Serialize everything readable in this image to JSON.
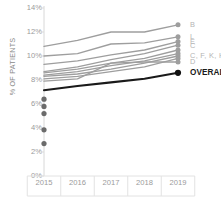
{
  "chart_data": {
    "type": "line",
    "title": "",
    "subtitle": "",
    "xlabel": "",
    "ylabel": "% OF PATIENTS",
    "x": [
      "2015",
      "2016",
      "2017",
      "2018",
      "2019"
    ],
    "xtick_labels": [
      "2015",
      "2016",
      "2017",
      "2018",
      "2019"
    ],
    "ytick_labels": [
      "0%",
      "2%",
      "4%",
      "6%",
      "8%",
      "10%",
      "12%",
      "14%"
    ],
    "ytick_values": [
      0,
      2,
      4,
      6,
      8,
      10,
      12,
      14
    ],
    "ylim": [
      0,
      14
    ],
    "grid": false,
    "legend_position": "right",
    "series": [
      {
        "name": "B",
        "color": "#9e9e9e",
        "values": [
          10.8,
          11.3,
          12.0,
          12.0,
          12.6
        ]
      },
      {
        "name": "L",
        "color": "#9e9e9e",
        "values": [
          10.0,
          10.2,
          11.0,
          11.1,
          11.6
        ]
      },
      {
        "name": "E",
        "color": "#9e9e9e",
        "values": [
          9.3,
          9.6,
          10.1,
          10.5,
          11.2
        ]
      },
      {
        "name": "C",
        "color": "#9e9e9e",
        "values": [
          8.7,
          9.1,
          9.7,
          10.2,
          10.9
        ]
      },
      {
        "name": "C, F, K, H",
        "color": "#9e9e9e",
        "values": [
          8.6,
          8.9,
          9.4,
          9.8,
          10.5
        ]
      },
      {
        "name": "F",
        "color": "#9e9e9e",
        "values": [
          8.4,
          8.7,
          9.2,
          9.6,
          10.2
        ]
      },
      {
        "name": "K",
        "color": "#9e9e9e",
        "values": [
          8.3,
          8.5,
          8.9,
          9.4,
          10.0
        ]
      },
      {
        "name": "H",
        "color": "#9e9e9e",
        "values": [
          8.1,
          8.3,
          8.7,
          9.1,
          9.8
        ]
      },
      {
        "name": "D",
        "color": "#9e9e9e",
        "values": [
          7.9,
          8.1,
          9.4,
          9.5,
          9.5
        ]
      },
      {
        "name": "OVERALL",
        "color": "#1a1a1a",
        "values": [
          7.15,
          7.5,
          7.8,
          8.1,
          8.6
        ]
      }
    ],
    "scatter_points_2015": [
      6.4,
      5.8,
      5.2,
      3.85,
      2.7
    ],
    "scatter_color": "#6b6b6b"
  },
  "legend": {
    "entries": [
      {
        "label": "B"
      },
      {
        "label": "L"
      },
      {
        "label": "E"
      },
      {
        "label": "C"
      },
      {
        "label": "C, F, K, H"
      },
      {
        "label": "D"
      },
      {
        "label": "OVERALL"
      }
    ]
  }
}
